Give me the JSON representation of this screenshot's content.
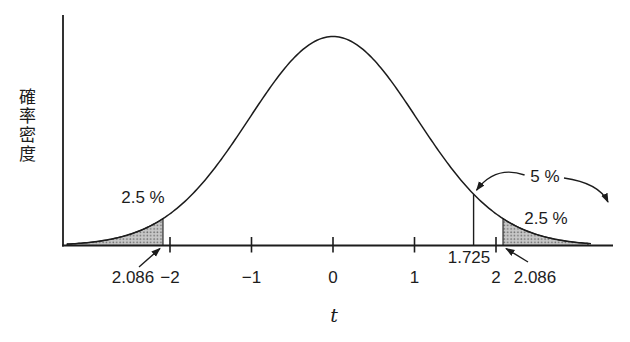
{
  "labels": {
    "ylabel": "確率密度",
    "xlabel": "t",
    "left_tail_pct": "2.5 %",
    "right_tail_pct": "2.5 %",
    "five_pct": "5 %",
    "one_sided_value": "1.725",
    "left_critical_value": "2.086",
    "right_critical_value": "2.086"
  },
  "chart_data": {
    "type": "area",
    "title": "",
    "xlabel": "t",
    "ylabel": "確率密度",
    "x_range": [
      -3.3,
      3.2
    ],
    "grid": false,
    "x_ticks": [
      {
        "value": -2,
        "label": "−2"
      },
      {
        "value": -1,
        "label": "−1"
      },
      {
        "value": 0,
        "label": "0"
      },
      {
        "value": 1,
        "label": "1"
      },
      {
        "value": 2,
        "label": "2"
      }
    ],
    "curve": {
      "shape": "bell",
      "peak_t": 0,
      "sigma_t": 1.03
    },
    "one_sided_critical": {
      "value": 1.725,
      "label": "1.725",
      "tail_area_label": "5 %"
    },
    "two_sided_critical": {
      "value": 2.086,
      "left_label": "2.086",
      "right_label": "2.086"
    },
    "shaded_regions": [
      {
        "from_t": -3.3,
        "to_t": -2.086,
        "area": 0.025,
        "label": "2.5 %"
      },
      {
        "from_t": 2.086,
        "to_t": 3.2,
        "area": 0.025,
        "label": "2.5 %"
      }
    ],
    "colors": {
      "ink": "#1c1c1c",
      "shade_dot": "#6f6f6f",
      "shade_bg": "#c7c7c7"
    }
  }
}
